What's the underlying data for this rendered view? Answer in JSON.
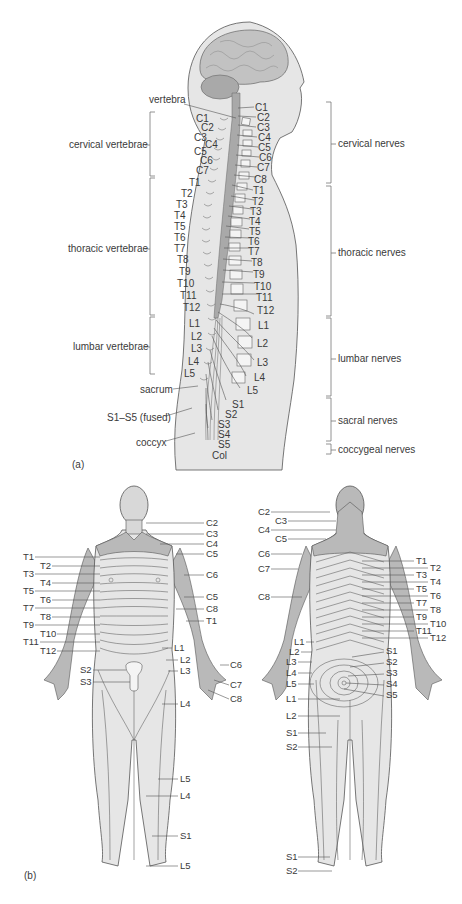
{
  "panel_a": {
    "caption": "(a)",
    "labels": {
      "vertebra": "vertebra",
      "sacrum": "sacrum",
      "fused": "S1–S5 (fused)",
      "coccyx": "coccyx"
    },
    "left_groups": [
      {
        "name": "cervical vertebrae",
        "y": 145
      },
      {
        "name": "thoracic vertebrae",
        "y": 249
      },
      {
        "name": "lumbar vertebrae",
        "y": 347
      }
    ],
    "right_groups": [
      {
        "name": "cervical nerves",
        "y": 144
      },
      {
        "name": "thoracic nerves",
        "y": 253
      },
      {
        "name": "lumbar nerves",
        "y": 359
      },
      {
        "name": "sacral nerves",
        "y": 421
      },
      {
        "name": "coccygeal nerves",
        "y": 450
      }
    ],
    "vertebrae_left": [
      "C1",
      "C2",
      "C3",
      "C4",
      "C5",
      "C6",
      "C7",
      "T1",
      "T2",
      "T3",
      "T4",
      "T5",
      "T6",
      "T7",
      "T8",
      "T9",
      "T10",
      "T11",
      "T12",
      "L1",
      "L2",
      "L3",
      "L4",
      "L5"
    ],
    "nerves_right": [
      "C1",
      "C2",
      "C3",
      "C4",
      "C5",
      "C6",
      "C7",
      "C8",
      "T1",
      "T2",
      "T3",
      "T4",
      "T5",
      "T6",
      "T7",
      "T8",
      "T9",
      "T10",
      "T11",
      "T12",
      "L1",
      "L2",
      "L3",
      "L4",
      "L5",
      "S1",
      "S2",
      "S3",
      "S4",
      "S5",
      "Col"
    ]
  },
  "panel_b": {
    "caption": "(b)",
    "front": {
      "right_labels": [
        "C2",
        "C3",
        "C4",
        "C5",
        "C6",
        "C5",
        "C8",
        "T1",
        "L1",
        "L2",
        "L3",
        "L4",
        "L5",
        "L4",
        "S1",
        "L5"
      ],
      "left_labels": [
        "T1",
        "T2",
        "T3",
        "T4",
        "T5",
        "T6",
        "T7",
        "T8",
        "T9",
        "T10",
        "T11",
        "T12",
        "S2",
        "S3"
      ],
      "hand_labels": [
        "C6",
        "C7",
        "C8"
      ]
    },
    "back": {
      "left_labels": [
        "C2",
        "C3",
        "C4",
        "C5",
        "C6",
        "C7",
        "C8",
        "L1",
        "L2",
        "L3",
        "L4",
        "L5",
        "L1",
        "L2",
        "S1",
        "S2",
        "S1",
        "S2"
      ],
      "right_labels": [
        "T1",
        "T2",
        "T3",
        "T4",
        "T5",
        "T6",
        "T7",
        "T8",
        "T9",
        "T10",
        "T11",
        "T12",
        "S1",
        "S2",
        "S3",
        "S4",
        "S5"
      ]
    }
  },
  "colors": {
    "body_fill": "#e6e6e6",
    "dermatome_dark": "#b9b9b9",
    "dermatome_mid": "#cfcfcf",
    "outline": "#555555",
    "text": "#3a3a3a"
  }
}
